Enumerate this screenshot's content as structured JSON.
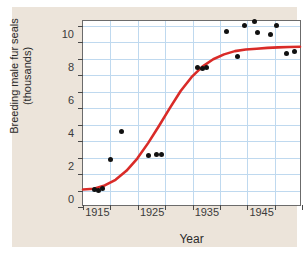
{
  "figure": {
    "background_color": "#ffffff",
    "panel_color": "#ece4da",
    "plot_background": "#ffffff",
    "frame_color": "#6b6b6b",
    "grid_color": "#bfd9ef",
    "curve_color": "#d92b28",
    "point_color": "#111111",
    "top_cut_text": "•        •      •                • •"
  },
  "chart_data": {
    "type": "scatter",
    "title": "",
    "xlabel": "Year",
    "ylabel": "Breeding male fur seals (thousands)",
    "ylabel_line1": "Breeding male fur seals",
    "ylabel_line2": "(thousands)",
    "xlim": [
      1910,
      1950
    ],
    "ylim": [
      0,
      11.3
    ],
    "grid": true,
    "legend": "none",
    "x_major_ticks": [
      1915,
      1925,
      1935,
      1945
    ],
    "x_major_tick_labels": [
      "1915",
      "1925",
      "1935",
      "1945"
    ],
    "x_minor_ticks": [
      1910,
      1920,
      1930,
      1940,
      1950
    ],
    "y_major_ticks": [
      0,
      2,
      4,
      6,
      8,
      10
    ],
    "y_major_tick_labels": [
      "0",
      "2",
      "4",
      "6",
      "8",
      "10"
    ],
    "y_minor_ticks": [
      1,
      3,
      5,
      7,
      9,
      11
    ],
    "points": [
      {
        "x": 1912.1,
        "y": 1.05
      },
      {
        "x": 1912.9,
        "y": 1.0
      },
      {
        "x": 1913.6,
        "y": 1.15
      },
      {
        "x": 1915.1,
        "y": 2.9
      },
      {
        "x": 1917.1,
        "y": 4.6
      },
      {
        "x": 1922.0,
        "y": 3.1
      },
      {
        "x": 1923.5,
        "y": 3.2
      },
      {
        "x": 1924.4,
        "y": 3.2
      },
      {
        "x": 1931.0,
        "y": 8.45
      },
      {
        "x": 1931.9,
        "y": 8.4
      },
      {
        "x": 1932.6,
        "y": 8.45
      },
      {
        "x": 1936.2,
        "y": 10.65
      },
      {
        "x": 1938.3,
        "y": 9.15
      },
      {
        "x": 1939.5,
        "y": 11.0
      },
      {
        "x": 1941.3,
        "y": 11.25
      },
      {
        "x": 1941.9,
        "y": 10.6
      },
      {
        "x": 1944.2,
        "y": 10.5
      },
      {
        "x": 1945.3,
        "y": 11.05
      },
      {
        "x": 1947.2,
        "y": 9.35
      },
      {
        "x": 1948.6,
        "y": 9.45
      }
    ],
    "fit_curve": {
      "name": "logistic fit",
      "color": "#d92b28",
      "x": [
        1910,
        1912,
        1914,
        1916,
        1918,
        1920,
        1922,
        1924,
        1926,
        1928,
        1930,
        1932,
        1934,
        1936,
        1938,
        1940,
        1942,
        1944,
        1946,
        1948,
        1950
      ],
      "y": [
        0.95,
        1.0,
        1.2,
        1.55,
        2.1,
        2.85,
        3.8,
        4.85,
        5.95,
        7.0,
        7.85,
        8.5,
        8.95,
        9.25,
        9.45,
        9.55,
        9.6,
        9.65,
        9.68,
        9.7,
        9.72
      ]
    }
  }
}
